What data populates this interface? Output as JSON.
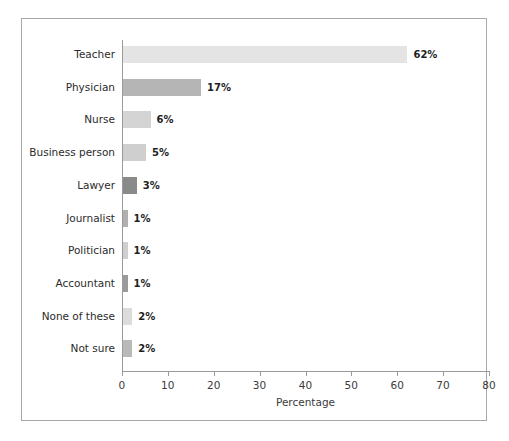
{
  "chart_data": {
    "type": "bar",
    "orientation": "horizontal",
    "title": "",
    "subtitle": "",
    "xlabel": "Percentage",
    "ylabel": "",
    "xlim": [
      0,
      80
    ],
    "xticks": [
      0,
      10,
      20,
      30,
      40,
      50,
      60,
      70,
      80
    ],
    "xtick_labels": [
      "0",
      "10",
      "20",
      "30",
      "40",
      "50",
      "60",
      "70",
      "80"
    ],
    "grid": false,
    "legend": null,
    "categories": [
      "Teacher",
      "Physician",
      "Nurse",
      "Business person",
      "Lawyer",
      "Journalist",
      "Politician",
      "Accountant",
      "None of these",
      "Not sure"
    ],
    "values": [
      62,
      17,
      6,
      5,
      3,
      1,
      1,
      1,
      2,
      2
    ],
    "value_labels": [
      "62%",
      "17%",
      "6%",
      "5%",
      "3%",
      "1%",
      "1%",
      "1%",
      "2%",
      "2%"
    ],
    "bar_colors": [
      "#e4e4e4",
      "#b5b5b5",
      "#d4d4d4",
      "#cfcfcf",
      "#8a8a8a",
      "#b0b0b0",
      "#cfcfcf",
      "#9a9a9a",
      "#dcdcdc",
      "#b9b9b9"
    ],
    "bars": [
      {
        "category": "Teacher",
        "value": 62,
        "label": "62%",
        "color": "#e4e4e4"
      },
      {
        "category": "Physician",
        "value": 17,
        "label": "17%",
        "color": "#b5b5b5"
      },
      {
        "category": "Nurse",
        "value": 6,
        "label": "6%",
        "color": "#d4d4d4"
      },
      {
        "category": "Business person",
        "value": 5,
        "label": "5%",
        "color": "#cfcfcf"
      },
      {
        "category": "Lawyer",
        "value": 3,
        "label": "3%",
        "color": "#8a8a8a"
      },
      {
        "category": "Journalist",
        "value": 1,
        "label": "1%",
        "color": "#b0b0b0"
      },
      {
        "category": "Politician",
        "value": 1,
        "label": "1%",
        "color": "#cfcfcf"
      },
      {
        "category": "Accountant",
        "value": 1,
        "label": "1%",
        "color": "#9a9a9a"
      },
      {
        "category": "None of these",
        "value": 2,
        "label": "2%",
        "color": "#dcdcdc"
      },
      {
        "category": "Not sure",
        "value": 2,
        "label": "2%",
        "color": "#b9b9b9"
      }
    ],
    "axis_color": "#9a9a9a",
    "frame_color": "#a8a8a8",
    "background_color": "#ffffff",
    "text_color": "#2b2b2b"
  }
}
